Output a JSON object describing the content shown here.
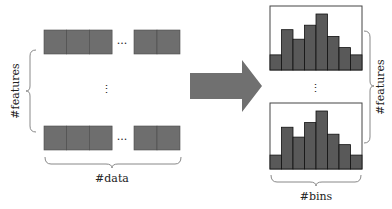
{
  "diagram": {
    "type": "data-to-histogram-transformation",
    "left": {
      "label_vertical": "#features",
      "label_horizontal": "#data",
      "row_ellipsis": "...",
      "column_ellipsis": "⋮",
      "rows": 2,
      "cells_left_group": 3,
      "cells_right_group": 2
    },
    "arrow": {
      "direction": "right"
    },
    "right": {
      "label_vertical": "#features",
      "label_horizontal": "#bins",
      "column_ellipsis": "⋮",
      "histograms": [
        {
          "bars": [
            0.27,
            0.72,
            0.55,
            0.8,
            1.0,
            0.6,
            0.4,
            0.27
          ]
        },
        {
          "bars": [
            0.24,
            0.72,
            0.55,
            0.8,
            1.0,
            0.6,
            0.42,
            0.24
          ]
        }
      ]
    },
    "colors": {
      "cell_fill": "#6e6e6e",
      "cell_stroke": "#4a4a4a",
      "bar_fill": "#595959",
      "bar_stroke": "#111111",
      "arrow_fill": "#707070",
      "brace": "#888888",
      "frame": "#444444"
    }
  }
}
